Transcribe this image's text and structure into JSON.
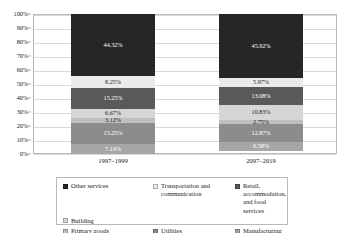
{
  "chart_data": {
    "type": "bar",
    "subtype": "100% stacked bar",
    "title": "",
    "xlabel": "",
    "ylabel": "",
    "ylim": [
      0,
      100
    ],
    "grid": true,
    "legend_position": "bottom",
    "categories": [
      "1997–1999",
      "2097–2019"
    ],
    "ytick_labels": [
      "0%",
      "10%",
      "20%",
      "30%",
      "40%",
      "50%",
      "60%",
      "70%",
      "80%",
      "90%",
      "100%"
    ],
    "ytick_values": [
      0,
      10,
      20,
      30,
      40,
      50,
      60,
      70,
      80,
      90,
      100
    ],
    "stack_order_top_to_bottom": [
      "Other services",
      "Transportation and communication",
      "Retail, accommodation, and food services",
      "Building",
      "Primary goods",
      "Utilities",
      "Manufacturing"
    ],
    "series": [
      {
        "name": "Other services",
        "color": "#262626",
        "label_color": "light",
        "values": [
          44.32,
          45.92
        ],
        "value_labels": [
          "44.32%",
          "45.92%"
        ]
      },
      {
        "name": "Transportation and communication",
        "color": "#eaeaea",
        "label_color": "dark",
        "values": [
          8.25,
          5.97
        ],
        "value_labels": [
          "8.25%",
          "5.97%"
        ]
      },
      {
        "name": "Retail, accommodation, and food services",
        "color": "#595959",
        "label_color": "light",
        "values": [
          15.25,
          13.08
        ],
        "value_labels": [
          "15.25%",
          "13.08%"
        ]
      },
      {
        "name": "Building",
        "color": "#d6d6d6",
        "label_color": "dark",
        "values": [
          6.67,
          10.83
        ],
        "value_labels": [
          "6.67%",
          "10.83%"
        ]
      },
      {
        "name": "Primary goods",
        "color": "#bfbfbf",
        "label_color": "dark",
        "values": [
          3.12,
          2.75
        ],
        "value_labels": [
          "3.12%",
          "2.75%"
        ]
      },
      {
        "name": "Utilities",
        "color": "#8c8c8c",
        "label_color": "light",
        "values": [
          15.25,
          12.87
        ],
        "value_labels": [
          "15.25%",
          "12.87%"
        ]
      },
      {
        "name": "Manufacturing",
        "color": "#a6a6a6",
        "label_color": "light",
        "values": [
          7.14,
          6.58
        ],
        "value_labels": [
          "7.14%",
          "6.58%"
        ]
      }
    ]
  },
  "legend": {
    "items": [
      {
        "label": "Other services",
        "color": "#262626"
      },
      {
        "label": "Transportation and communication",
        "color": "#eaeaea"
      },
      {
        "label": "Retail, accommodation, and food services",
        "color": "#595959"
      },
      {
        "label": "Building",
        "color": "#d6d6d6"
      },
      {
        "label": "Primary goods",
        "color": "#bfbfbf"
      },
      {
        "label": "Utilities",
        "color": "#8c8c8c"
      },
      {
        "label": "Manufacturing",
        "color": "#a6a6a6"
      }
    ]
  }
}
